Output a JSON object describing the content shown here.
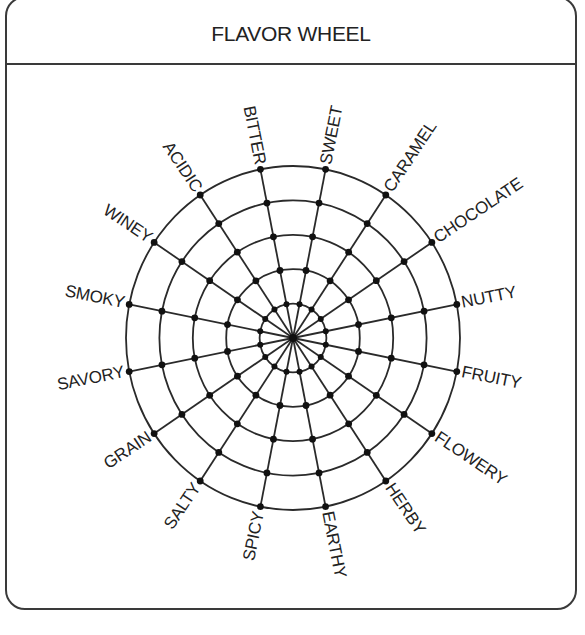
{
  "title": "FLAVOR WHEEL",
  "colors": {
    "line": "#2a2a2a",
    "dot": "#111111",
    "text": "#222222",
    "frame": "#3a3a3a"
  },
  "wheel": {
    "center": [
      293,
      338
    ],
    "radius_x": 167,
    "radius_y": 172,
    "rings": 5,
    "spoke_count": 16,
    "start_angle_deg": -11.25,
    "step_deg": -22.5
  },
  "flavors": [
    "NUTTY",
    "CHOCOLATE",
    "CARAMEL",
    "SWEET",
    "BITTER",
    "ACIDIC",
    "WINEY",
    "SMOKY",
    "SAVORY",
    "GRAIN",
    "SALTY",
    "SPICY",
    "EARTHY",
    "HERBY",
    "FLOWERY",
    "FRUITY"
  ]
}
